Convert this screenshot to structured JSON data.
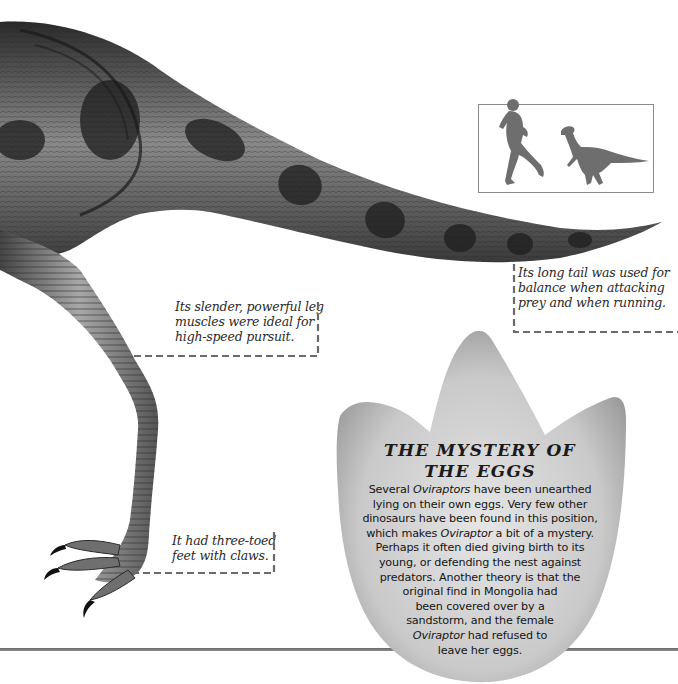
{
  "page": {
    "background": "#ffffff",
    "rule_color": "#777777"
  },
  "illustration": {
    "subject": "Oviraptor hindquarters, leg and tail",
    "icon": "dinosaur-illustration"
  },
  "scale_box": {
    "icons": [
      "human-runner-silhouette-icon",
      "dinosaur-silhouette-icon"
    ],
    "fill_color": "#6e6e6e"
  },
  "captions": {
    "tail": {
      "lines": [
        "Its long tail was used for",
        "balance when attacking",
        "prey and when running."
      ]
    },
    "leg": {
      "lines": [
        "Its slender, powerful leg",
        "muscles were ideal for",
        "high-speed pursuit."
      ]
    },
    "feet": {
      "lines": [
        "It had three-toed",
        "feet with claws."
      ]
    }
  },
  "egg_panel": {
    "title_line1": "THE MYSTERY OF",
    "title_line2": "THE EGGS",
    "body_lines": [
      [
        "Several ",
        "Oviraptors",
        " have been unearthed"
      ],
      [
        "lying on their own eggs. Very few other",
        "",
        ""
      ],
      [
        "dinosaurs have been found in this position,",
        "",
        ""
      ],
      [
        "which makes ",
        "Oviraptor",
        " a bit of a mystery."
      ],
      [
        "Perhaps it often died giving birth to its",
        "",
        ""
      ],
      [
        "young, or defending the nest against",
        "",
        ""
      ],
      [
        "predators. Another theory is that the",
        "",
        ""
      ],
      [
        "original find in Mongolia had",
        "",
        ""
      ],
      [
        "been covered over by a",
        "",
        ""
      ],
      [
        "sandstorm, and the female",
        "",
        ""
      ],
      [
        "",
        "Oviraptor",
        " had refused to"
      ],
      [
        "leave her eggs.",
        "",
        ""
      ]
    ]
  }
}
